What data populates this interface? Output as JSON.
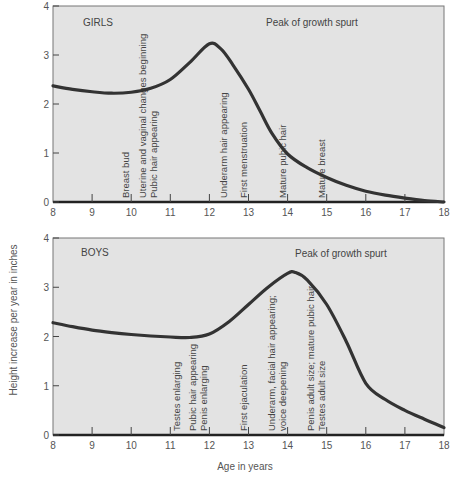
{
  "chart_data": [
    {
      "type": "line",
      "title": "GIRLS",
      "annotation_top": "Peak of growth spurt",
      "xlabel": "Age in years",
      "ylabel": "Height increase per year in inches",
      "xlim": [
        8,
        18
      ],
      "ylim": [
        0,
        4
      ],
      "xticks": [
        8,
        9,
        10,
        11,
        12,
        13,
        14,
        15,
        16,
        17,
        18
      ],
      "yticks": [
        0,
        1,
        2,
        3,
        4
      ],
      "grid": false,
      "series": [
        {
          "name": "Girls",
          "x": [
            8,
            8.5,
            9,
            9.5,
            10,
            10.5,
            11,
            11.5,
            12,
            12.3,
            12.6,
            13,
            13.3,
            13.6,
            14,
            14.5,
            15,
            15.5,
            16,
            16.5,
            17,
            17.5,
            18
          ],
          "y": [
            2.37,
            2.3,
            2.25,
            2.22,
            2.24,
            2.32,
            2.5,
            2.85,
            3.23,
            3.12,
            2.8,
            2.3,
            1.85,
            1.4,
            0.98,
            0.7,
            0.5,
            0.34,
            0.22,
            0.14,
            0.08,
            0.03,
            0.0
          ]
        }
      ],
      "milestones": [
        {
          "age": 10.0,
          "lines": [
            "Breast bud"
          ]
        },
        {
          "age": 10.7,
          "lines": [
            "Uterine and vaginal changes beginning",
            "Pubic hair appearing"
          ]
        },
        {
          "age": 12.5,
          "lines": [
            "Underarm hair appearing"
          ]
        },
        {
          "age": 13.0,
          "lines": [
            "First menstruation"
          ]
        },
        {
          "age": 14.0,
          "lines": [
            "Mature pubic hair"
          ]
        },
        {
          "age": 15.0,
          "lines": [
            "Mature breast"
          ]
        }
      ]
    },
    {
      "type": "line",
      "title": "BOYS",
      "annotation_top": "Peak of growth spurt",
      "xlabel": "Age in years",
      "ylabel": "Height increase per year in inches",
      "xlim": [
        8,
        18
      ],
      "ylim": [
        0,
        4
      ],
      "xticks": [
        8,
        9,
        10,
        11,
        12,
        13,
        14,
        15,
        16,
        17,
        18
      ],
      "yticks": [
        0,
        1,
        2,
        3,
        4
      ],
      "grid": false,
      "series": [
        {
          "name": "Boys",
          "x": [
            8,
            8.5,
            9,
            9.5,
            10,
            10.5,
            11,
            11.5,
            12,
            12.5,
            13,
            13.5,
            14,
            14.2,
            14.5,
            15,
            15.5,
            16,
            16.5,
            17,
            17.5,
            18
          ],
          "y": [
            2.28,
            2.2,
            2.13,
            2.08,
            2.04,
            2.01,
            1.99,
            1.98,
            2.05,
            2.3,
            2.65,
            3.0,
            3.28,
            3.3,
            3.15,
            2.65,
            1.9,
            1.05,
            0.72,
            0.5,
            0.32,
            0.15
          ]
        }
      ],
      "milestones": [
        {
          "age": 11.3,
          "lines": [
            "Testes enlarging"
          ]
        },
        {
          "age": 12.0,
          "lines": [
            "Pubic hair appearing",
            "Penis enlarging"
          ]
        },
        {
          "age": 13.0,
          "lines": [
            "First ejaculation"
          ]
        },
        {
          "age": 14.0,
          "lines": [
            "Underarm, facial hair appearing;",
            "voice deepening"
          ]
        },
        {
          "age": 15.0,
          "lines": [
            "Penis adult size; mature pubic hair",
            "Testes adult size"
          ]
        }
      ]
    }
  ],
  "labels": {
    "ylabel": "Height increase per year in inches",
    "xlabel": "Age in years",
    "girls_title": "GIRLS",
    "boys_title": "BOYS",
    "peak_label": "Peak of growth spurt"
  },
  "colors": {
    "plot_bg": "#e3e3e3",
    "curve": "#333333",
    "text": "#555555"
  }
}
